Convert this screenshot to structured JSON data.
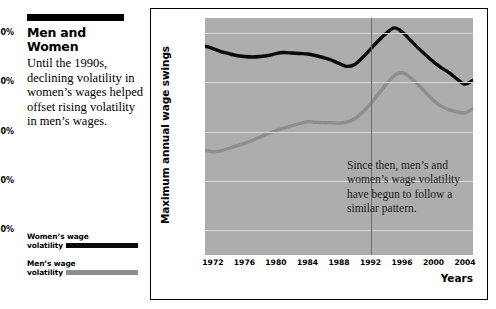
{
  "article": {
    "headline": "Men and Women",
    "deck": "Until the 1990s, declining volatility in women’s wages helped offset rising volatility in men’s wages."
  },
  "legend": {
    "items": [
      {
        "label_line1": "Women’s wage",
        "label_line2": "volatility",
        "color": "#0a0a0a",
        "name": "women-wage-volatility"
      },
      {
        "label_line1": "Men’s wage",
        "label_line2": "volatility",
        "color": "#8e8e8e",
        "name": "men-wage-volatility"
      }
    ]
  },
  "chart_data": {
    "type": "line",
    "title": "",
    "xlabel": "Years",
    "ylabel": "Maximum annual wage swings",
    "xlim": [
      1971,
      2005
    ],
    "ylim": [
      5,
      53
    ],
    "grid": true,
    "legend_position": "external-left",
    "plot_background": "#adadad",
    "gridline_color": "#d8d8d8",
    "xticks": [
      "1972",
      "1976",
      "1980",
      "1984",
      "1988",
      "1992",
      "1996",
      "2000",
      "2004"
    ],
    "xtick_values": [
      1972,
      1976,
      1980,
      1984,
      1988,
      1992,
      1996,
      2000,
      2004
    ],
    "yticks": [
      "10%",
      "20%",
      "30%",
      "40%",
      "50%"
    ],
    "ytick_values": [
      10,
      20,
      30,
      40,
      50
    ],
    "x": [
      1971,
      1972,
      1973,
      1974,
      1975,
      1976,
      1977,
      1978,
      1979,
      1980,
      1981,
      1982,
      1983,
      1984,
      1985,
      1986,
      1987,
      1988,
      1989,
      1990,
      1991,
      1992,
      1993,
      1994,
      1995,
      1996,
      1997,
      1998,
      1999,
      2000,
      2001,
      2002,
      2003,
      2004,
      2005
    ],
    "series": [
      {
        "name": "Women’s wage volatility",
        "color": "#0a0a0a",
        "width": 3.4,
        "values": [
          47.3,
          46.8,
          46.2,
          45.8,
          45.4,
          45.2,
          45.1,
          45.2,
          45.4,
          45.8,
          46.0,
          45.9,
          45.8,
          45.7,
          45.4,
          45.0,
          44.5,
          43.8,
          43.2,
          43.6,
          45.0,
          46.7,
          48.4,
          49.9,
          51.0,
          50.2,
          48.6,
          47.0,
          45.5,
          44.1,
          42.9,
          41.9,
          40.6,
          39.6,
          40.4
        ]
      },
      {
        "name": "Men’s wage volatility",
        "color": "#8e8e8e",
        "width": 3.4,
        "values": [
          26.2,
          25.9,
          26.1,
          26.6,
          27.1,
          27.6,
          28.2,
          28.9,
          29.6,
          30.2,
          30.7,
          31.2,
          31.6,
          32.0,
          31.9,
          31.8,
          31.8,
          31.7,
          31.9,
          32.6,
          33.9,
          35.6,
          37.6,
          39.6,
          41.3,
          41.9,
          41.0,
          39.6,
          37.9,
          36.3,
          35.1,
          34.4,
          34.0,
          33.8,
          34.7
        ]
      }
    ],
    "vertical_marker": {
      "x": 1992,
      "color": "#6b6b6b"
    },
    "annotation": "Since then, men’s and women’s wage volatility have begun to follow a similar pattern."
  }
}
